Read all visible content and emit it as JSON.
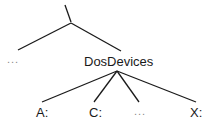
{
  "diagram": {
    "type": "tree",
    "line_color": "#1a1a1a",
    "root": {
      "label": "\\"
    },
    "level1": [
      {
        "label": "..."
      },
      {
        "label": "DosDevices"
      }
    ],
    "level2": [
      {
        "label": "A:"
      },
      {
        "label": "C:"
      },
      {
        "label": "..."
      },
      {
        "label": "X:"
      }
    ]
  }
}
